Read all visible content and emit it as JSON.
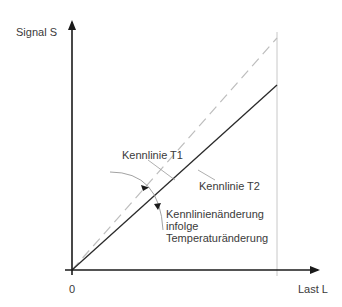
{
  "diagram": {
    "axes": {
      "y_label": "Signal S",
      "x_label": "Last L",
      "origin_label": "0"
    },
    "curves": {
      "t1_label": "Kennlinie T1",
      "t2_label": "Kennlinie T2"
    },
    "annotation": {
      "line1": "Kennlinienänderung",
      "line2": "infolge",
      "line3": "Temperaturänderung"
    },
    "colors": {
      "axis": "#1a1a1a",
      "t2_solid": "#2a2a2a",
      "t1_dashed": "#bdbdbd",
      "guide": "#c8c8c8",
      "leader": "#9a9a9a"
    }
  }
}
